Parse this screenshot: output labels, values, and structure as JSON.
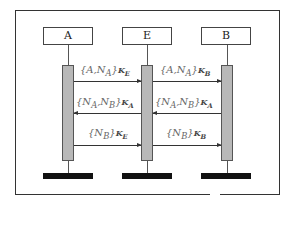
{
  "diagram": {
    "type": "sequence",
    "participants": [
      {
        "id": "A",
        "label": "A"
      },
      {
        "id": "E",
        "label": "E"
      },
      {
        "id": "B",
        "label": "B"
      }
    ],
    "messages": [
      {
        "from": "A",
        "to": "E",
        "label": "{A,N_A}",
        "key": "K_E"
      },
      {
        "from": "E",
        "to": "B",
        "label": "{A,N_A}",
        "key": "K_B"
      },
      {
        "from": "E",
        "to": "A",
        "label": "{N_A,N_B}",
        "key": "K_A"
      },
      {
        "from": "B",
        "to": "E",
        "label": "{N_A,N_B}",
        "key": "K_A"
      },
      {
        "from": "A",
        "to": "E",
        "label": "{N_B}",
        "key": "K_E"
      },
      {
        "from": "E",
        "to": "B",
        "label": "{N_B}",
        "key": "K_B"
      }
    ],
    "display": {
      "m1": {
        "body": "{A,N",
        "sub": "A",
        "close": "}",
        "key": "K",
        "ksub": "E"
      },
      "m2": {
        "body": "{A,N",
        "sub": "A",
        "close": "}",
        "key": "K",
        "ksub": "B"
      },
      "m3": {
        "body": "{N",
        "sub": "A",
        "mid": ",N",
        "sub2": "B",
        "close": "}",
        "key": "K",
        "ksub": "A"
      },
      "m4": {
        "body": "{N",
        "sub": "A",
        "mid": ",N",
        "sub2": "B",
        "close": "}",
        "key": "K",
        "ksub": "A"
      },
      "m5": {
        "body": "{N",
        "sub": "B",
        "close": "}",
        "key": "K",
        "ksub": "E"
      },
      "m6": {
        "body": "{N",
        "sub": "B",
        "close": "}",
        "key": "K",
        "ksub": "B"
      }
    }
  }
}
